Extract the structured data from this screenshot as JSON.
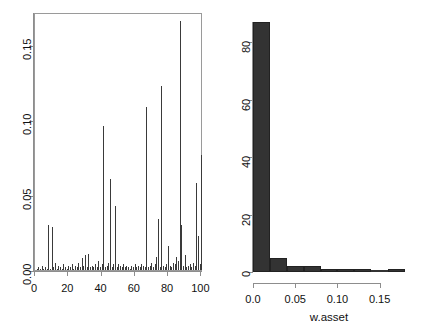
{
  "figure": {
    "panels": [
      "asset-weight-index-plot",
      "asset-weight-histogram"
    ]
  },
  "chart_data": [
    {
      "type": "bar",
      "name": "asset-weight-spike-plot",
      "title": "",
      "xlabel": "",
      "ylabel": "",
      "xlim": [
        0,
        101
      ],
      "ylim": [
        0.0,
        0.172
      ],
      "grid": false,
      "legend": null,
      "xticks": [
        0,
        20,
        40,
        60,
        80,
        100
      ],
      "xtick_labels": [
        "0",
        "20",
        "40",
        "60",
        "80",
        "100"
      ],
      "yticks": [
        0.0,
        0.05,
        0.1,
        0.15
      ],
      "ytick_labels": [
        "0.00",
        "0.05",
        "0.10",
        "0.15"
      ],
      "x": [
        1,
        2,
        3,
        4,
        5,
        6,
        7,
        8,
        9,
        10,
        11,
        12,
        13,
        14,
        15,
        16,
        17,
        18,
        19,
        20,
        21,
        22,
        23,
        24,
        25,
        26,
        27,
        28,
        29,
        30,
        31,
        32,
        33,
        34,
        35,
        36,
        37,
        38,
        39,
        40,
        41,
        42,
        43,
        44,
        45,
        46,
        47,
        48,
        49,
        50,
        51,
        52,
        53,
        54,
        55,
        56,
        57,
        58,
        59,
        60,
        61,
        62,
        63,
        64,
        65,
        66,
        67,
        68,
        69,
        70,
        71,
        72,
        73,
        74,
        75,
        76,
        77,
        78,
        79,
        80,
        81,
        82,
        83,
        84,
        85,
        86,
        87,
        88,
        89,
        90,
        91,
        92,
        93,
        94,
        95,
        96,
        97,
        98,
        99,
        100
      ],
      "values": [
        0.001,
        0.002,
        0.001,
        0.003,
        0.001,
        0.002,
        0.001,
        0.03,
        0.001,
        0.029,
        0.002,
        0.005,
        0.001,
        0.003,
        0.002,
        0.001,
        0.004,
        0.002,
        0.001,
        0.003,
        0.002,
        0.004,
        0.001,
        0.003,
        0.002,
        0.005,
        0.002,
        0.008,
        0.003,
        0.01,
        0.002,
        0.011,
        0.002,
        0.003,
        0.002,
        0.004,
        0.002,
        0.006,
        0.002,
        0.004,
        0.096,
        0.002,
        0.003,
        0.005,
        0.061,
        0.002,
        0.004,
        0.043,
        0.002,
        0.004,
        0.003,
        0.002,
        0.004,
        0.002,
        0.003,
        0.002,
        0.001,
        0.003,
        0.002,
        0.004,
        0.002,
        0.003,
        0.002,
        0.004,
        0.003,
        0.002,
        0.109,
        0.002,
        0.003,
        0.005,
        0.002,
        0.004,
        0.009,
        0.034,
        0.002,
        0.123,
        0.003,
        0.002,
        0.004,
        0.016,
        0.003,
        0.002,
        0.005,
        0.004,
        0.009,
        0.006,
        0.166,
        0.03,
        0.003,
        0.01,
        0.002,
        0.003,
        0.004,
        0.002,
        0.005,
        0.003,
        0.058,
        0.023,
        0.004,
        0.077
      ]
    },
    {
      "type": "bar",
      "name": "w-asset-histogram",
      "title": "",
      "xlabel": "w.asset",
      "ylabel": "",
      "xlim": [
        0.0,
        0.18
      ],
      "ylim": [
        0,
        87
      ],
      "grid": false,
      "legend": null,
      "xticks": [
        0.0,
        0.05,
        0.1,
        0.15
      ],
      "xtick_labels": [
        "0.0",
        "0.05",
        "0.10",
        "0.15"
      ],
      "yticks": [
        0,
        20,
        40,
        60,
        80
      ],
      "ytick_labels": [
        "0",
        "20",
        "40",
        "60",
        "80"
      ],
      "bin_edges": [
        0.0,
        0.02,
        0.04,
        0.06,
        0.08,
        0.1,
        0.12,
        0.14,
        0.16,
        0.18
      ],
      "categories": [
        "0.00-0.02",
        "0.02-0.04",
        "0.04-0.06",
        "0.06-0.08",
        "0.08-0.10",
        "0.10-0.12",
        "0.12-0.14",
        "0.14-0.16",
        "0.16-0.18"
      ],
      "values": [
        87,
        5,
        2,
        2,
        1,
        1,
        1,
        0,
        1
      ],
      "bar_color": "#333333"
    }
  ]
}
